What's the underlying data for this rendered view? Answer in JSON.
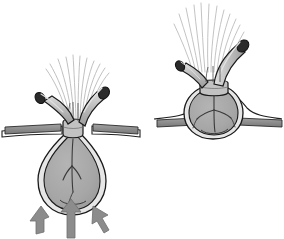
{
  "figure": {
    "title": "Anatomical illustration of hernia sac reduction",
    "width": 284,
    "height": 239,
    "background_color": "#ffffff",
    "caption": ""
  },
  "palette": {
    "outline": "#1a1a1a",
    "sac_fill": "#a8a8a8",
    "sac_rim": "#e2e2e2",
    "vessel_fill": "#b0b0b0",
    "vessel_highlight": "#d8d8d8",
    "vessel_lumen": "#2b2b2b",
    "fascia_fill": "#8e8e8e",
    "fascia_outline": "#2a2a2a",
    "fiber_stroke": "#b4b4b4",
    "arrow_fill": "#8c8c8c",
    "arrow_outline": "#6e6e6e",
    "ring_fill": "#bdbdbd"
  },
  "panels": [
    {
      "id": "left-panel",
      "name": "protruding-sac-panel",
      "label": "",
      "state": "protruded",
      "components": [
        {
          "name": "hernia-sac",
          "shape": "pear",
          "fill": "#a8a8a8"
        },
        {
          "name": "constriction-ring",
          "shape": "collar"
        },
        {
          "name": "vessel-left",
          "orientation": "upper-left"
        },
        {
          "name": "vessel-right",
          "orientation": "upper-right"
        },
        {
          "name": "fascia-plate-left",
          "orientation": "horizontal"
        },
        {
          "name": "fascia-plate-right",
          "orientation": "horizontal"
        },
        {
          "name": "fiber-bundle",
          "count": 11
        },
        {
          "name": "internal-branching",
          "branches": 3
        }
      ],
      "arrows": {
        "name": "pressure-arrows",
        "count": 3,
        "direction": "up",
        "label": ""
      }
    },
    {
      "id": "right-panel",
      "name": "reduced-sac-panel",
      "label": "",
      "state": "reduced",
      "components": [
        {
          "name": "hernia-sac",
          "shape": "round",
          "fill": "#a8a8a8"
        },
        {
          "name": "constriction-ring",
          "shape": "collar"
        },
        {
          "name": "vessel-left",
          "orientation": "upper-left"
        },
        {
          "name": "vessel-right",
          "orientation": "upper-right"
        },
        {
          "name": "fascia-plate-left",
          "orientation": "horizontal"
        },
        {
          "name": "fascia-plate-right",
          "orientation": "horizontal"
        },
        {
          "name": "fiber-bundle",
          "count": 12
        },
        {
          "name": "internal-branching",
          "branches": 3
        }
      ],
      "arrows": {
        "name": "pressure-arrows",
        "count": 0,
        "direction": "",
        "label": ""
      }
    }
  ]
}
